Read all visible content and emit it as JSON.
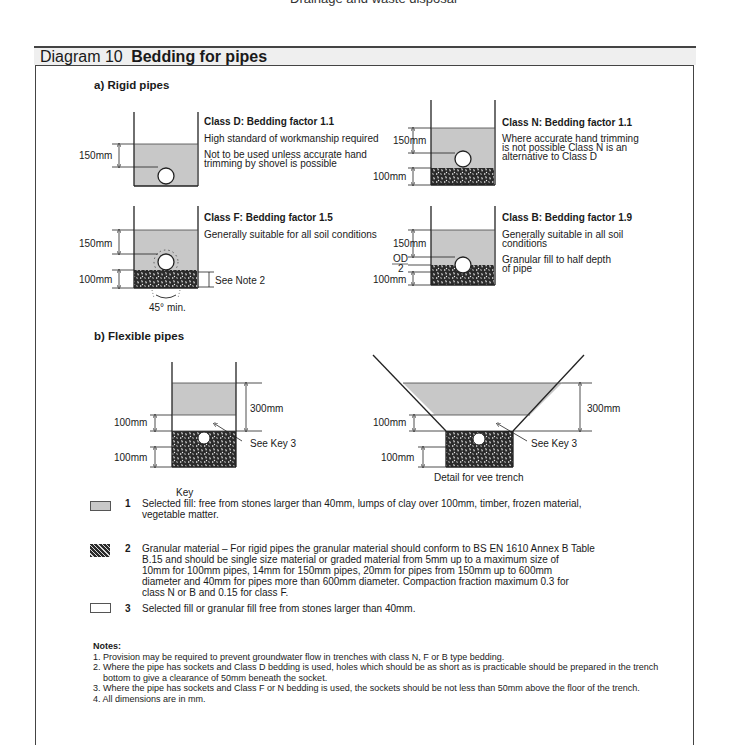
{
  "page_header_cut": "Drainage and waste disposal",
  "diagram": {
    "number": "Diagram 10",
    "title": "Bedding for pipes"
  },
  "sections": {
    "rigid": "a) Rigid pipes",
    "flexible": "b) Flexible pipes"
  },
  "rigid_classes": [
    {
      "id": "D",
      "heading": "Class D: Bedding factor 1.1",
      "lines": [
        "High standard of workmanship required",
        "Not to be used unless accurate hand",
        "trimming by shovel is possible"
      ],
      "dims": [
        "150mm"
      ]
    },
    {
      "id": "N",
      "heading": "Class N: Bedding factor 1.1",
      "lines": [
        "Where accurate hand trimming",
        "is not possible Class N is an",
        "alternative to Class D"
      ],
      "dims": [
        "150mm",
        "100mm"
      ]
    },
    {
      "id": "F",
      "heading": "Class F: Bedding factor 1.5",
      "lines": [
        "Generally suitable for all soil conditions"
      ],
      "dims": [
        "150mm",
        "100mm"
      ],
      "note_ref": "See Note 2",
      "angle": "45° min."
    },
    {
      "id": "B",
      "heading": "Class B: Bedding factor 1.9",
      "lines": [
        "Generally suitable in all soil",
        "conditions",
        "Granular fill to half depth",
        "of pipe"
      ],
      "dims": [
        "150mm",
        "OD",
        "2",
        "100mm"
      ]
    }
  ],
  "flexible": {
    "standard": {
      "dims": [
        "300mm",
        "100mm",
        "100mm"
      ],
      "pointer": "See Key 3"
    },
    "vee": {
      "dims": [
        "300mm",
        "100mm",
        "100mm"
      ],
      "pointer": "See Key 3",
      "caption": "Detail for vee trench"
    }
  },
  "key": {
    "title": "Key",
    "items": [
      {
        "num": "1",
        "swatch": "selected-fill",
        "color": "#c8c8c8",
        "lines": [
          "Selected fill: free from stones larger than 40mm, lumps of clay over 100mm, timber, frozen material,",
          "vegetable matter."
        ]
      },
      {
        "num": "2",
        "swatch": "granular-material",
        "color": "#333333",
        "lines": [
          "Granular material – For rigid pipes the granular material should conform to BS EN 1610 Annex B Table",
          "B.15 and should be single size material or graded material from 5mm up to a maximum size of",
          "10mm for 100mm pipes, 14mm for 150mm pipes, 20mm for pipes from 150mm up to 600mm",
          "diameter and 40mm for pipes more than 600mm diameter. Compaction fraction maximum 0.3 for",
          "class N or B and 0.15 for class F."
        ]
      },
      {
        "num": "3",
        "swatch": "granular-fill",
        "color": "#ffffff",
        "lines": [
          "Selected fill or granular fill free from stones larger than 40mm."
        ]
      }
    ]
  },
  "notes": {
    "title": "Notes:",
    "items": [
      "1. Provision may be required to prevent groundwater flow in trenches with class N, F or B type bedding.",
      "2. Where the pipe has sockets and Class D bedding is used, holes which should be as short as is practicable should be prepared in the trench bottom to give a clearance of 50mm beneath the socket.",
      "3. Where the pipe has sockets and Class F or N bedding is used, the sockets should be not less than 50mm above the floor of the trench.",
      "4. All dimensions are in mm."
    ]
  },
  "colors": {
    "selected_fill": "#c8c8c8",
    "granular": "#2b2b2b",
    "title_band": "#efefef",
    "border": "#444444"
  }
}
